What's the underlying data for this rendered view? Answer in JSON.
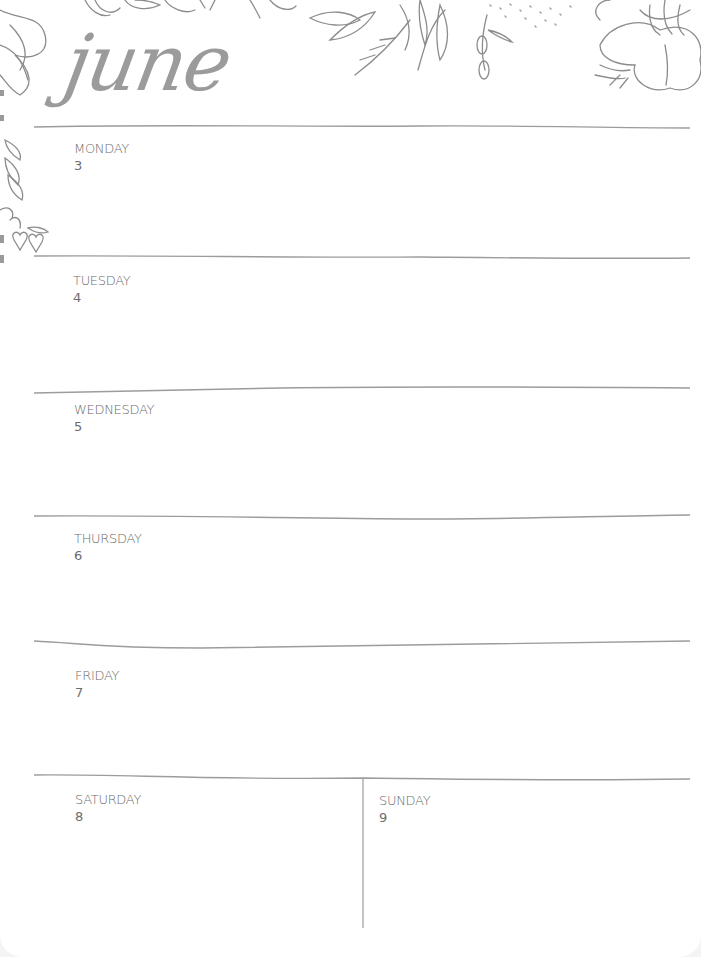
{
  "planner": {
    "month": "june",
    "days": [
      {
        "name": "MONDAY",
        "date": "3"
      },
      {
        "name": "TUESDAY",
        "date": "4"
      },
      {
        "name": "WEDNESDAY",
        "date": "5"
      },
      {
        "name": "THURSDAY",
        "date": "6"
      },
      {
        "name": "FRIDAY",
        "date": "7"
      },
      {
        "name": "SATURDAY",
        "date": "8"
      },
      {
        "name": "SUNDAY",
        "date": "9"
      }
    ]
  },
  "colors": {
    "line": "#9c9c9c",
    "text": "#6c6c6c",
    "illustration": "#8c8c8c"
  }
}
